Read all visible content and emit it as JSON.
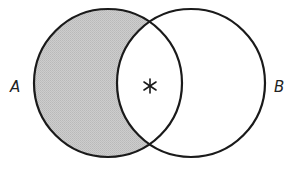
{
  "diagram": {
    "type": "venn",
    "sets": [
      {
        "id": "A",
        "label": "A",
        "cx": 108,
        "cy": 83,
        "r": 74
      },
      {
        "id": "B",
        "label": "B",
        "cx": 191,
        "cy": 83,
        "r": 74
      }
    ],
    "shaded_region": "A - B",
    "marker": {
      "symbol": "*",
      "region": "A ∩ B",
      "x": 150,
      "y": 86
    },
    "colors": {
      "stroke": "#1a1a1a",
      "shade": "#c6c6c6",
      "background": "#ffffff"
    }
  }
}
